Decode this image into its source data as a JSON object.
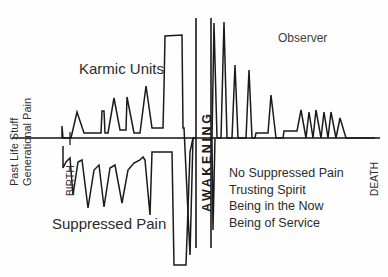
{
  "figure": {
    "title_text_labels": {
      "karmic_units": "Karmic Units",
      "suppressed_pain": "Suppressed Pain",
      "observer": "Observer",
      "awakening": "AWAKENING",
      "birth": "BIRTH",
      "death": "DEATH",
      "past_life_stuff": "Past Life Stuff",
      "generational_pain": "Generational Pain"
    },
    "right_list": [
      "No Suppressed Pain",
      "Trusting Spirit",
      "Being in the Now",
      "Being of Service"
    ],
    "colors": {
      "background": "#fefefe",
      "stroke": "#1a1a1a",
      "text": "#2b2b2b",
      "axis": "#111111"
    }
  },
  "chart_data": {
    "type": "line",
    "xlabel": "",
    "ylabel": "Karmic Units",
    "grid": false,
    "legend": "none",
    "xlim": [
      0,
      388
    ],
    "ylim": [
      0,
      277
    ],
    "baseline_y": 138,
    "annotations": [
      {
        "text": "Karmic Units",
        "x": 79,
        "y": 72
      },
      {
        "text": "Suppressed Pain",
        "x": 52,
        "y": 228
      },
      {
        "text": "Observer",
        "x": 278,
        "y": 43
      },
      {
        "text": "AWAKENING",
        "x": 204,
        "y": 150,
        "rotation": -90
      },
      {
        "text": "BIRTH",
        "x": 68,
        "y": 190,
        "rotation": -90
      },
      {
        "text": "DEATH",
        "x": 372,
        "y": 190,
        "rotation": -90
      },
      {
        "text": "Past Life Stuff",
        "x": 12,
        "y": 150,
        "rotation": -90
      },
      {
        "text": "Generational Pain",
        "x": 25,
        "y": 155,
        "rotation": -90
      },
      {
        "text": "No Suppressed Pain",
        "x": 229,
        "y": 172
      },
      {
        "text": "Trusting Spirit",
        "x": 229,
        "y": 188
      },
      {
        "text": "Being in the Now",
        "x": 229,
        "y": 205
      },
      {
        "text": "Being of Service",
        "x": 229,
        "y": 221
      }
    ],
    "axis_line": {
      "x1": 12,
      "y1": 138,
      "x2": 380,
      "y2": 138
    },
    "awakening_band": {
      "x_left": 196,
      "x_right": 211,
      "y_top": 18,
      "y_bottom": 248
    },
    "series": [
      {
        "name": "Karmic Units (above baseline)",
        "points": [
          [
            62,
            138
          ],
          [
            62,
            126
          ],
          [
            63,
            138
          ],
          [
            71,
            138
          ],
          [
            77,
            112
          ],
          [
            84,
            133
          ],
          [
            101,
            133
          ],
          [
            102,
            111
          ],
          [
            104,
            111
          ],
          [
            105,
            133
          ],
          [
            108,
            133
          ],
          [
            114,
            98
          ],
          [
            120,
            130
          ],
          [
            126,
            130
          ],
          [
            127,
            97
          ],
          [
            134,
            133
          ],
          [
            140,
            133
          ],
          [
            146,
            86
          ],
          [
            152,
            128
          ],
          [
            163,
            128
          ],
          [
            164,
            88
          ],
          [
            165,
            36
          ],
          [
            182,
            35
          ],
          [
            183,
            128
          ],
          [
            184,
            128
          ],
          [
            190,
            255
          ],
          [
            193,
            138
          ],
          [
            196,
            138
          ]
        ]
      },
      {
        "name": "Suppressed Pain (below baseline)",
        "points": [
          [
            63,
            146
          ],
          [
            63,
            168
          ],
          [
            66,
            162
          ],
          [
            70,
            158
          ],
          [
            73,
            195
          ],
          [
            78,
            162
          ],
          [
            82,
            160
          ],
          [
            88,
            208
          ],
          [
            94,
            170
          ],
          [
            99,
            165
          ],
          [
            104,
            207
          ],
          [
            110,
            168
          ],
          [
            115,
            165
          ],
          [
            122,
            203
          ],
          [
            128,
            170
          ],
          [
            134,
            163
          ],
          [
            140,
            160
          ],
          [
            143,
            157
          ],
          [
            145,
            160
          ],
          [
            150,
            215
          ],
          [
            152,
            152
          ],
          [
            155,
            152
          ],
          [
            172,
            152
          ],
          [
            174,
            265
          ],
          [
            186,
            265
          ],
          [
            190,
            152
          ],
          [
            193,
            138
          ]
        ]
      },
      {
        "name": "Post-awakening spikes (decaying)",
        "points": [
          [
            212,
            138
          ],
          [
            214,
            23
          ],
          [
            217,
            138
          ],
          [
            221,
            138
          ],
          [
            224,
            22
          ],
          [
            227,
            138
          ],
          [
            232,
            138
          ],
          [
            235,
            65
          ],
          [
            238,
            138
          ],
          [
            246,
            138
          ],
          [
            249,
            70
          ],
          [
            252,
            138
          ],
          [
            255,
            138
          ],
          [
            256,
            133
          ],
          [
            268,
            133
          ],
          [
            271,
            95
          ],
          [
            276,
            138
          ],
          [
            283,
            138
          ],
          [
            284,
            131
          ],
          [
            297,
            131
          ],
          [
            301,
            110
          ],
          [
            306,
            138
          ],
          [
            309,
            112
          ],
          [
            313,
            138
          ],
          [
            316,
            110
          ],
          [
            321,
            138
          ],
          [
            324,
            112
          ],
          [
            328,
            138
          ],
          [
            331,
            112
          ],
          [
            336,
            138
          ],
          [
            340,
            118
          ],
          [
            346,
            138
          ],
          [
            375,
            138
          ]
        ]
      },
      {
        "name": "Post-awakening below-baseline spike",
        "points": [
          [
            212,
            138
          ],
          [
            213,
            230
          ],
          [
            215,
            138
          ]
        ]
      }
    ]
  }
}
